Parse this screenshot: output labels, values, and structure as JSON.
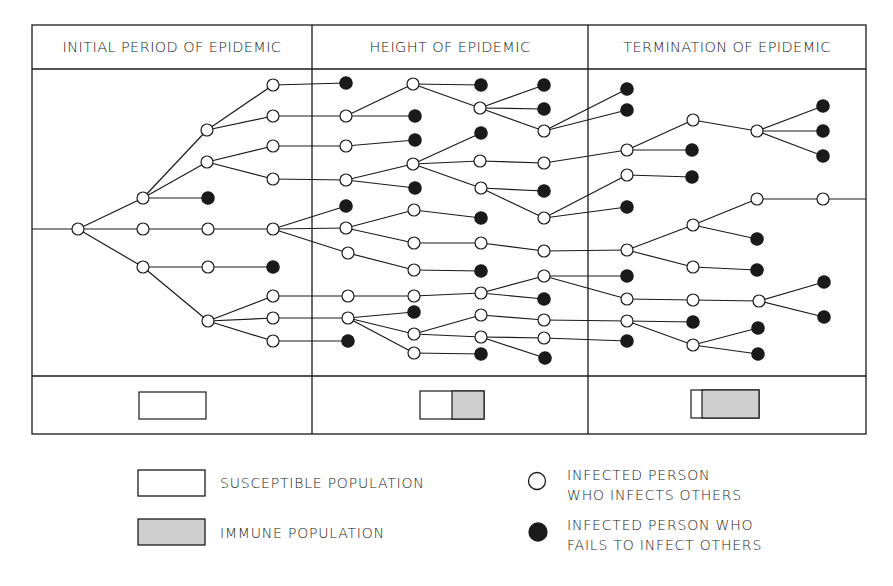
{
  "headers": [
    {
      "label": "INITIAL PERIOD OF EPIDEMIC"
    },
    {
      "label": "HEIGHT OF EPIDEMIC"
    },
    {
      "label": "TERMINATION OF EPIDEMIC"
    }
  ],
  "colors": {
    "line": "#1a1a1a",
    "filled_node": "#1a1a1a",
    "open_node": "#ffffff",
    "immune": "#cfcfcf"
  },
  "population_bars": [
    {
      "period": "initial",
      "susceptible_fraction": 1.0,
      "immune_fraction": 0.0
    },
    {
      "period": "height",
      "susceptible_fraction": 0.5,
      "immune_fraction": 0.5
    },
    {
      "period": "termination",
      "susceptible_fraction": 0.15,
      "immune_fraction": 0.85
    }
  ],
  "legend": {
    "susceptible": "SUSCEPTIBLE POPULATION",
    "immune": "IMMUNE POPULATION",
    "infects_line1": "INFECTED PERSON",
    "infects_line2": "WHO INFECTS OTHERS",
    "fails_line1": "INFECTED PERSON WHO",
    "fails_line2": "FAILS TO INFECT OTHERS"
  },
  "tree": {
    "nodes": {
      "r": [
        78,
        229,
        "o"
      ],
      "a1": [
        143,
        198,
        "o"
      ],
      "a2": [
        143,
        229,
        "o"
      ],
      "a3": [
        143,
        267,
        "o"
      ],
      "b1": [
        207,
        130,
        "o"
      ],
      "b2": [
        207,
        162,
        "o"
      ],
      "b3": [
        208,
        198,
        "f"
      ],
      "b4": [
        208,
        229,
        "o"
      ],
      "b5": [
        208,
        267,
        "o"
      ],
      "b6": [
        208,
        321,
        "o"
      ],
      "c1": [
        273,
        85,
        "o"
      ],
      "c2": [
        273,
        116,
        "o"
      ],
      "c3": [
        273,
        146,
        "o"
      ],
      "c4": [
        273,
        179,
        "o"
      ],
      "c5": [
        273,
        229,
        "o"
      ],
      "c6": [
        273,
        267,
        "f"
      ],
      "c7": [
        273,
        296,
        "o"
      ],
      "c8": [
        273,
        318,
        "o"
      ],
      "c9": [
        273,
        341,
        "o"
      ],
      "d1": [
        346,
        83,
        "f"
      ],
      "d2": [
        346,
        116,
        "o"
      ],
      "d3": [
        346,
        146,
        "o"
      ],
      "d4": [
        346,
        180,
        "o"
      ],
      "d5": [
        346,
        206,
        "f"
      ],
      "d6": [
        346,
        228,
        "o"
      ],
      "d7": [
        348,
        253,
        "o"
      ],
      "d8": [
        348,
        296,
        "o"
      ],
      "d9": [
        348,
        318,
        "o"
      ],
      "d10": [
        348,
        341,
        "f"
      ],
      "e1": [
        413,
        84,
        "o"
      ],
      "e2": [
        415,
        116,
        "f"
      ],
      "e3": [
        415,
        140,
        "f"
      ],
      "e4": [
        413,
        164,
        "o"
      ],
      "e5": [
        415,
        188,
        "f"
      ],
      "e6": [
        414,
        210,
        "o"
      ],
      "e7": [
        414,
        243,
        "o"
      ],
      "e8": [
        414,
        270,
        "o"
      ],
      "e9": [
        414,
        296,
        "o"
      ],
      "e10": [
        414,
        312,
        "f"
      ],
      "e11": [
        414,
        334,
        "o"
      ],
      "e12": [
        414,
        353,
        "o"
      ],
      "f1": [
        481,
        85,
        "f"
      ],
      "f2": [
        480,
        108,
        "o"
      ],
      "f3": [
        481,
        133,
        "f"
      ],
      "f4": [
        480,
        161,
        "o"
      ],
      "f5": [
        481,
        188,
        "o"
      ],
      "f6": [
        481,
        218,
        "f"
      ],
      "f7": [
        481,
        243,
        "o"
      ],
      "f8": [
        481,
        271,
        "f"
      ],
      "f9": [
        481,
        293,
        "o"
      ],
      "f10": [
        481,
        315,
        "o"
      ],
      "f11": [
        481,
        337,
        "o"
      ],
      "f12": [
        481,
        354,
        "f"
      ],
      "g1": [
        544,
        85,
        "f"
      ],
      "g2": [
        544,
        109,
        "f"
      ],
      "g3": [
        544,
        131,
        "o"
      ],
      "g4": [
        544,
        163,
        "o"
      ],
      "g5": [
        544,
        191,
        "f"
      ],
      "g6": [
        544,
        218,
        "o"
      ],
      "g7": [
        544,
        251,
        "o"
      ],
      "g8": [
        544,
        276,
        "o"
      ],
      "g9": [
        544,
        299,
        "f"
      ],
      "g10": [
        544,
        320,
        "o"
      ],
      "g11": [
        544,
        338,
        "o"
      ],
      "g12": [
        545,
        358,
        "f"
      ],
      "h1": [
        627,
        89,
        "f"
      ],
      "h2": [
        627,
        110,
        "f"
      ],
      "h3": [
        627,
        150,
        "o"
      ],
      "h4": [
        627,
        175,
        "o"
      ],
      "h5": [
        627,
        207,
        "f"
      ],
      "h6": [
        627,
        250,
        "o"
      ],
      "h7": [
        627,
        276,
        "f"
      ],
      "h8": [
        627,
        299,
        "o"
      ],
      "h9": [
        627,
        321,
        "o"
      ],
      "h10": [
        627,
        341,
        "f"
      ],
      "i1": [
        693,
        120,
        "o"
      ],
      "i2": [
        692,
        150,
        "f"
      ],
      "i3": [
        692,
        177,
        "f"
      ],
      "i4": [
        693,
        225,
        "o"
      ],
      "i5": [
        693,
        267,
        "o"
      ],
      "i6": [
        693,
        300,
        "o"
      ],
      "i7": [
        693,
        322,
        "f"
      ],
      "i8": [
        693,
        345,
        "o"
      ],
      "j1": [
        757,
        131,
        "o"
      ],
      "j2": [
        757,
        199,
        "o"
      ],
      "j3": [
        757,
        239,
        "f"
      ],
      "j4": [
        757,
        270,
        "f"
      ],
      "j5": [
        759,
        301,
        "o"
      ],
      "j6": [
        758,
        328,
        "f"
      ],
      "j7": [
        758,
        354,
        "f"
      ],
      "k1": [
        823,
        106,
        "f"
      ],
      "k2": [
        823,
        131,
        "f"
      ],
      "k3": [
        823,
        156,
        "f"
      ],
      "k4": [
        823,
        199,
        "o"
      ],
      "k5": [
        824,
        282,
        "f"
      ],
      "k6": [
        824,
        317,
        "f"
      ]
    },
    "edges": [
      [
        "r",
        "a1"
      ],
      [
        "r",
        "a2"
      ],
      [
        "r",
        "a3"
      ],
      [
        "a1",
        "b1"
      ],
      [
        "a1",
        "b2"
      ],
      [
        "a1",
        "b3"
      ],
      [
        "a2",
        "b4"
      ],
      [
        "a3",
        "b5"
      ],
      [
        "a3",
        "b6"
      ],
      [
        "b1",
        "c1"
      ],
      [
        "b1",
        "c2"
      ],
      [
        "b2",
        "c3"
      ],
      [
        "b2",
        "c4"
      ],
      [
        "b4",
        "c5"
      ],
      [
        "b5",
        "c6"
      ],
      [
        "b6",
        "c7"
      ],
      [
        "b6",
        "c8"
      ],
      [
        "b6",
        "c9"
      ],
      [
        "c1",
        "d1"
      ],
      [
        "c2",
        "d2"
      ],
      [
        "c3",
        "d3"
      ],
      [
        "c4",
        "d4"
      ],
      [
        "c5",
        "d5"
      ],
      [
        "c5",
        "d6"
      ],
      [
        "c5",
        "d7"
      ],
      [
        "c7",
        "d8"
      ],
      [
        "c8",
        "d9"
      ],
      [
        "c9",
        "d10"
      ],
      [
        "d2",
        "e1"
      ],
      [
        "d2",
        "e2"
      ],
      [
        "d3",
        "e3"
      ],
      [
        "d4",
        "e4"
      ],
      [
        "d4",
        "e5"
      ],
      [
        "d6",
        "e6"
      ],
      [
        "d6",
        "e7"
      ],
      [
        "d7",
        "e8"
      ],
      [
        "d8",
        "e9"
      ],
      [
        "d9",
        "e10"
      ],
      [
        "d9",
        "e11"
      ],
      [
        "d9",
        "e12"
      ],
      [
        "e1",
        "f1"
      ],
      [
        "e1",
        "f2"
      ],
      [
        "e4",
        "f3"
      ],
      [
        "e4",
        "f4"
      ],
      [
        "e4",
        "f5"
      ],
      [
        "e6",
        "f6"
      ],
      [
        "e7",
        "f7"
      ],
      [
        "e8",
        "f8"
      ],
      [
        "e9",
        "f9"
      ],
      [
        "e11",
        "f10"
      ],
      [
        "e11",
        "f11"
      ],
      [
        "e12",
        "f12"
      ],
      [
        "f2",
        "g1"
      ],
      [
        "f2",
        "g2"
      ],
      [
        "f2",
        "g3"
      ],
      [
        "f4",
        "g4"
      ],
      [
        "f5",
        "g5"
      ],
      [
        "f5",
        "g6"
      ],
      [
        "f7",
        "g7"
      ],
      [
        "f9",
        "g8"
      ],
      [
        "f9",
        "g9"
      ],
      [
        "f10",
        "g10"
      ],
      [
        "f11",
        "g11"
      ],
      [
        "f11",
        "g12"
      ],
      [
        "g3",
        "h1"
      ],
      [
        "g3",
        "h2"
      ],
      [
        "g4",
        "h3"
      ],
      [
        "g6",
        "h4"
      ],
      [
        "g6",
        "h5"
      ],
      [
        "g7",
        "h6"
      ],
      [
        "g8",
        "h7"
      ],
      [
        "g8",
        "h8"
      ],
      [
        "g10",
        "h9"
      ],
      [
        "g11",
        "h10"
      ],
      [
        "h3",
        "i1"
      ],
      [
        "h3",
        "i2"
      ],
      [
        "h4",
        "i3"
      ],
      [
        "h6",
        "i4"
      ],
      [
        "h6",
        "i5"
      ],
      [
        "h8",
        "i6"
      ],
      [
        "h9",
        "i7"
      ],
      [
        "h9",
        "i8"
      ],
      [
        "i1",
        "j1"
      ],
      [
        "i4",
        "j2"
      ],
      [
        "i4",
        "j3"
      ],
      [
        "i5",
        "j4"
      ],
      [
        "i6",
        "j5"
      ],
      [
        "i8",
        "j6"
      ],
      [
        "i8",
        "j7"
      ],
      [
        "j1",
        "k1"
      ],
      [
        "j1",
        "k2"
      ],
      [
        "j1",
        "k3"
      ],
      [
        "j2",
        "k4"
      ],
      [
        "j5",
        "k5"
      ],
      [
        "j5",
        "k6"
      ]
    ]
  }
}
